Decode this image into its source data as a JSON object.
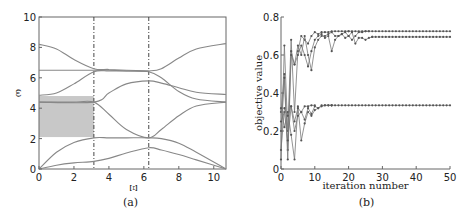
{
  "chart_data": [
    {
      "id": "a",
      "type": "line",
      "caption": "(a)",
      "title": "",
      "xlabel": "Ξ",
      "ylabel": "ω",
      "xlim": [
        0,
        10.7
      ],
      "ylim": [
        0,
        10
      ],
      "xticks": [
        0,
        2,
        4,
        6,
        8,
        10
      ],
      "yticks": [
        0,
        2,
        4,
        6,
        8,
        10
      ],
      "grid": false,
      "vlines_dashdot": [
        3.14,
        6.28
      ],
      "shaded_band": {
        "x": [
          0,
          3.14
        ],
        "y": [
          2.1,
          4.8
        ],
        "color": "#c8c8c8"
      },
      "line_color": "#888888",
      "series": [
        {
          "name": "band1",
          "x": [
            0,
            1,
            2,
            3.14,
            4,
            5,
            6.28,
            7,
            8,
            9,
            10.7
          ],
          "y": [
            0,
            0.25,
            0.4,
            0.5,
            0.7,
            1.05,
            1.4,
            1.25,
            0.95,
            0.6,
            0
          ]
        },
        {
          "name": "band2",
          "x": [
            0,
            1,
            2,
            3.14,
            4,
            5,
            6.28,
            7,
            8,
            9,
            10.7
          ],
          "y": [
            0,
            1.1,
            1.75,
            2.05,
            2.05,
            2.05,
            2.05,
            2.0,
            1.7,
            1.1,
            0
          ]
        },
        {
          "name": "band3",
          "x": [
            0,
            1,
            2,
            3.14,
            4,
            5,
            6.28,
            7,
            8,
            9,
            10.7
          ],
          "y": [
            4.4,
            4.4,
            4.4,
            4.4,
            3.6,
            2.6,
            2.05,
            2.6,
            3.5,
            4.15,
            4.4
          ]
        },
        {
          "name": "band4",
          "x": [
            0,
            1,
            2,
            3.14,
            4,
            5,
            6.28,
            7,
            8,
            9,
            10.7
          ],
          "y": [
            4.85,
            5.0,
            5.6,
            6.4,
            6.45,
            6.45,
            6.4,
            6.0,
            5.1,
            4.6,
            4.4
          ]
        },
        {
          "name": "band5",
          "x": [
            0,
            3.14,
            4,
            5,
            6.28,
            7,
            8,
            9,
            10.7
          ],
          "y": [
            4.4,
            4.4,
            5.0,
            5.6,
            5.8,
            5.65,
            5.35,
            5.05,
            4.9
          ]
        },
        {
          "name": "band6",
          "x": [
            0,
            1,
            2,
            3.14,
            4,
            5,
            6.28,
            7,
            8,
            9,
            10.7
          ],
          "y": [
            6.5,
            6.5,
            6.5,
            6.5,
            6.5,
            6.45,
            6.45,
            6.6,
            7.3,
            7.9,
            8.25
          ]
        },
        {
          "name": "band7",
          "x": [
            0,
            1,
            2,
            3.14,
            4,
            5,
            6.28
          ],
          "y": [
            8.2,
            7.9,
            7.2,
            6.6,
            6.55,
            6.5,
            6.45
          ]
        }
      ]
    },
    {
      "id": "b",
      "type": "line",
      "caption": "(b)",
      "title": "",
      "xlabel": "iteration number",
      "ylabel": "objective value",
      "xlim": [
        0,
        50
      ],
      "ylim": [
        0,
        0.8
      ],
      "xticks": [
        0,
        10,
        20,
        30,
        40,
        50
      ],
      "yticks": [
        0,
        0.2,
        0.4,
        0.6,
        0.8
      ],
      "ytick_labels": [
        "0",
        "0.2",
        "0.4",
        "0.6",
        "0.8"
      ],
      "grid": false,
      "marker": "circle",
      "line_color": "#777777",
      "series": [
        {
          "name": "run1",
          "x": [
            0,
            1,
            2,
            3,
            4,
            5,
            6,
            7,
            8,
            9,
            10,
            11,
            12,
            13,
            14,
            15,
            16,
            17,
            18,
            19,
            20
          ],
          "y": [
            0.05,
            0.65,
            0.2,
            0.68,
            0.3,
            0.62,
            0.7,
            0.68,
            0.66,
            0.7,
            0.72,
            0.71,
            0.72,
            0.72,
            0.72,
            0.725,
            0.725,
            0.725,
            0.725,
            0.725,
            0.725
          ]
        },
        {
          "name": "run2",
          "x": [
            0,
            1,
            2,
            3,
            4,
            5,
            6,
            7,
            8,
            9,
            10,
            11,
            12,
            13,
            14,
            15,
            16,
            17,
            18,
            19,
            20,
            21,
            22,
            23,
            24,
            25,
            26
          ],
          "y": [
            0.3,
            0.5,
            0.1,
            0.62,
            0.55,
            0.6,
            0.65,
            0.6,
            0.54,
            0.62,
            0.68,
            0.7,
            0.71,
            0.69,
            0.7,
            0.62,
            0.68,
            0.7,
            0.71,
            0.72,
            0.7,
            0.68,
            0.7,
            0.72,
            0.72,
            0.725,
            0.725
          ]
        },
        {
          "name": "run3",
          "x": [
            0,
            1,
            2,
            3,
            4,
            5,
            6,
            7,
            8,
            9,
            10,
            11,
            12,
            13,
            14,
            15,
            16,
            17,
            18,
            19,
            20,
            21,
            22,
            23,
            24,
            25,
            26,
            27
          ],
          "y": [
            0.2,
            0.48,
            0.05,
            0.6,
            0.55,
            0.65,
            0.6,
            0.7,
            0.6,
            0.52,
            0.64,
            0.68,
            0.7,
            0.7,
            0.71,
            0.72,
            0.7,
            0.7,
            0.71,
            0.69,
            0.7,
            0.72,
            0.66,
            0.69,
            0.69,
            0.68,
            0.69,
            0.695
          ]
        },
        {
          "name": "run4",
          "x": [
            0,
            1,
            2,
            3,
            4,
            5,
            6,
            7,
            8,
            9,
            10,
            11,
            12,
            13,
            14,
            15
          ],
          "y": [
            0.32,
            0.22,
            0.3,
            0.18,
            0.05,
            0.33,
            0.15,
            0.24,
            0.3,
            0.28,
            0.31,
            0.32,
            0.33,
            0.335,
            0.335,
            0.335
          ]
        },
        {
          "name": "run5",
          "x": [
            0,
            1,
            2,
            3,
            4,
            5,
            6,
            7,
            8,
            9,
            10,
            11,
            12,
            13,
            14,
            15
          ],
          "y": [
            0.25,
            0.3,
            0.15,
            0.33,
            0.2,
            0.28,
            0.3,
            0.26,
            0.32,
            0.29,
            0.33,
            0.32,
            0.335,
            0.335,
            0.335,
            0.335
          ]
        },
        {
          "name": "run6",
          "x": [
            0,
            1,
            2,
            3,
            4,
            5,
            6,
            7,
            8,
            9,
            10
          ],
          "y": [
            0.1,
            0.32,
            0.28,
            0.33,
            0.25,
            0.32,
            0.3,
            0.33,
            0.33,
            0.335,
            0.335
          ]
        }
      ],
      "plateaus": [
        {
          "value": 0.725,
          "from": 20,
          "to": 50
        },
        {
          "value": 0.695,
          "from": 27,
          "to": 50
        },
        {
          "value": 0.335,
          "from": 15,
          "to": 50
        }
      ]
    }
  ]
}
